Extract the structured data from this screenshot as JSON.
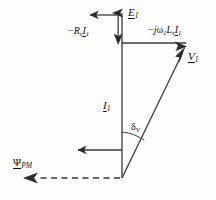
{
  "figure": {
    "type": "phasor-diagram",
    "background_color": "#fefefe",
    "line_color": "#3a3a3a",
    "text_color": "#111111"
  },
  "geometry": {
    "origin": {
      "x": 122,
      "y": 178
    },
    "emf_tip": {
      "x": 122,
      "y": 12
    },
    "junction": {
      "x": 122,
      "y": 43
    },
    "voltage_tip": {
      "x": 186,
      "y": 46
    },
    "flux_tip": {
      "x": 24,
      "y": 178
    },
    "current_arrow_tip": {
      "x": 122,
      "y": 104
    },
    "arc_radius": 46,
    "load_angle_degrees": 21
  },
  "labels": {
    "emf": {
      "symbol": "E",
      "subscript": "1",
      "underlined": true,
      "name": "back-emf-phasor"
    },
    "resistive_drop": {
      "prefix": "−",
      "symbol": "R",
      "subscript_1": "s",
      "symbol2": "I",
      "subscript_2": "1",
      "underlined": true,
      "name": "resistive-voltage-drop"
    },
    "reactive_drop": {
      "prefix": "−",
      "j": "j",
      "omega": "ω",
      "omega_sub": "1",
      "inductance": "L",
      "inductance_sub": "s",
      "current": "I",
      "current_sub": "1",
      "underlined": true,
      "name": "inductive-voltage-drop"
    },
    "voltage": {
      "symbol": "V",
      "subscript": "1",
      "underlined": true,
      "name": "terminal-voltage-phasor"
    },
    "current": {
      "symbol": "I",
      "subscript": "1",
      "underlined": true,
      "name": "stator-current-phasor"
    },
    "load_angle": {
      "symbol": "δ",
      "subscript": "V",
      "name": "voltage-load-angle"
    },
    "pm_flux": {
      "symbol": "Ψ",
      "subscript": "PM",
      "underlined": true,
      "name": "permanent-magnet-flux-linkage"
    }
  },
  "vectors": [
    {
      "name": "back-emf",
      "style": "solid",
      "direction": "up",
      "label_key": "emf"
    },
    {
      "name": "resistive-drop",
      "style": "solid",
      "direction": "down",
      "label_key": "resistive_drop"
    },
    {
      "name": "inductive-drop",
      "style": "solid",
      "direction": "right",
      "label_key": "reactive_drop"
    },
    {
      "name": "terminal-voltage",
      "style": "solid",
      "direction": "up-right",
      "label_key": "voltage"
    },
    {
      "name": "stator-current",
      "style": "solid",
      "direction": "up",
      "label_key": "current"
    },
    {
      "name": "pm-flux-linkage",
      "style": "dashed",
      "direction": "left",
      "label_key": "pm_flux"
    }
  ]
}
